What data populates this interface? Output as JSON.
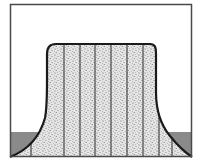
{
  "diagram": {
    "colors": {
      "background": "#ffffff",
      "frame": "#4a4a4a",
      "outline": "#1a1a1a",
      "stipple_fill": "#e4e4e4",
      "stipple_dots": "#6a6a6a",
      "section_lines": "#2a2a2a",
      "base_band": "#8a8a8a"
    },
    "frame": {
      "x": 10,
      "y": 4,
      "width": 182,
      "height": 153
    },
    "plateau": {
      "top_y": 44,
      "left_x": 47,
      "right_x": 156
    },
    "base_band": {
      "top_y": 132,
      "bottom_y": 157
    },
    "section_lines_x": [
      31,
      46,
      64,
      80,
      95,
      111,
      127,
      143,
      159,
      172
    ]
  }
}
